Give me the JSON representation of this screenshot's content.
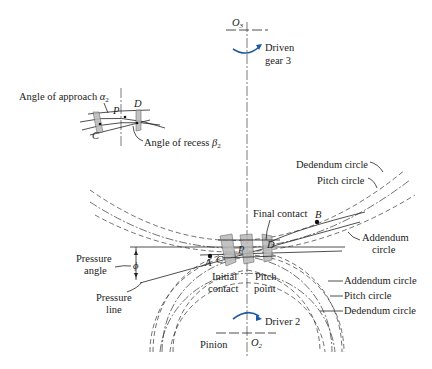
{
  "diagram": {
    "centers": {
      "driven": "O",
      "driven_sub": "3",
      "driver": "O",
      "driver_sub": "2"
    },
    "rotation_labels": {
      "driven_line1": "Driven",
      "driven_line2": "gear 3",
      "driver": "Driver 2"
    },
    "inset": {
      "approach_label": "Angle of approach ",
      "approach_symbol": "α",
      "approach_sub": "2",
      "recess_label": "Angle of recess ",
      "recess_symbol": "β",
      "recess_sub": "2",
      "point_p": "P",
      "point_c": "C",
      "point_d": "D"
    },
    "gear3_circles": {
      "dedendum": "Dedendum circle",
      "pitch": "Pitch circle",
      "addendum_line1": "Addendum",
      "addendum_line2": "circle"
    },
    "gear2_circles": {
      "addendum": "Addendum circle",
      "pitch": "Pitch circle",
      "dedendum": "Dedendum circle"
    },
    "contact": {
      "final": "Final contact",
      "initial_line1": "Initial",
      "initial_line2": "contact",
      "pitch_point_line1": "Pitch",
      "pitch_point_line2": "point",
      "point_a": "A",
      "point_b": "B",
      "point_c": "C",
      "point_d": "D",
      "point_p": "P"
    },
    "pressure": {
      "angle_line1": "Pressure",
      "angle_line2": "angle",
      "phi": "ϕ",
      "line_line1": "Pressure",
      "line_line2": "line"
    },
    "pinion_label": "Pinion"
  }
}
